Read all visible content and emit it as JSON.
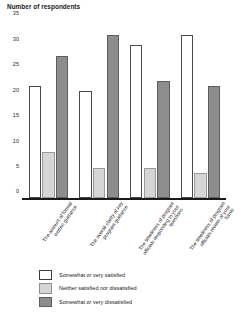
{
  "chart_data": {
    "type": "bar",
    "title": "Number of respondents",
    "xlabel": "",
    "ylabel": "",
    "ylim": [
      0,
      35
    ],
    "yticks": [
      0,
      5,
      10,
      15,
      20,
      25,
      30,
      35
    ],
    "grid": false,
    "legend_position": "bottom",
    "categories": [
      "The amount of formal written guidance",
      "The overall clarity of key program guidance",
      "The timeliness of program officials responding to your questions",
      "The timeliness of program officials review of your forms"
    ],
    "series": [
      {
        "name": "Somewhat or very satisfied",
        "color": "#ffffff",
        "values": [
          22,
          21,
          30,
          32
        ]
      },
      {
        "name": "Neither satisfied nor dissatisfied",
        "color": "#d5d5d5",
        "values": [
          9,
          6,
          6,
          5
        ]
      },
      {
        "name": "Somewhat or very dissatisfied",
        "color": "#8d8d8d",
        "values": [
          28,
          32,
          23,
          22
        ]
      }
    ]
  }
}
